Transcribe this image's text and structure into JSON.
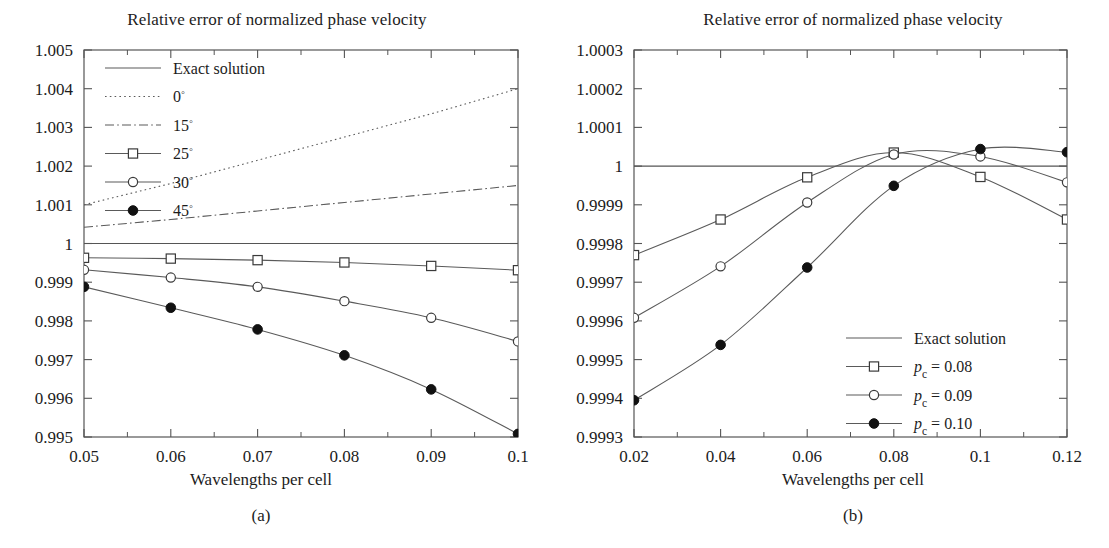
{
  "figure": {
    "background": "#ffffff",
    "line_color": "#5a5a5a",
    "axis_color": "#555555",
    "text_color": "#1c1c1c"
  },
  "panels": [
    {
      "key": "a",
      "title": "Relative error of normalized phase velocity",
      "xlabel": "Wavelengths per cell",
      "subcaption": "(a)"
    },
    {
      "key": "b",
      "title": "Relative error of normalized phase velocity",
      "xlabel": "Wavelengths per cell",
      "subcaption": "(b)"
    }
  ],
  "chart_data": [
    {
      "id": "panel-a",
      "type": "line",
      "title": "Relative error of normalized phase velocity",
      "xlabel": "Wavelengths per cell",
      "ylabel": "",
      "xlim": [
        0.05,
        0.1
      ],
      "ylim": [
        0.995,
        1.005
      ],
      "xticks": [
        0.05,
        0.06,
        0.07,
        0.08,
        0.09,
        0.1
      ],
      "xtick_labels": [
        "0.05",
        "0.06",
        "0.07",
        "0.08",
        "0.09",
        "0.1"
      ],
      "xminor_step": 0.005,
      "yticks": [
        0.995,
        0.996,
        0.997,
        0.998,
        0.999,
        1,
        1.001,
        1.002,
        1.003,
        1.004,
        1.005
      ],
      "ytick_labels": [
        "0.995",
        "0.996",
        "0.997",
        "0.998",
        "0.999",
        "1",
        "1.001",
        "1.002",
        "1.003",
        "1.004",
        "1.005"
      ],
      "grid": false,
      "legend_position": "upper-left",
      "series": [
        {
          "name": "Exact solution",
          "style": "solid",
          "marker": "none",
          "x": [
            0.05,
            0.1
          ],
          "values": [
            1,
            1
          ]
        },
        {
          "name": "0°",
          "style": "dotted",
          "marker": "none",
          "x": [
            0.05,
            0.06,
            0.07,
            0.08,
            0.09,
            0.1
          ],
          "values": [
            1.001,
            1.00155,
            1.00215,
            1.00275,
            1.00335,
            1.004
          ]
        },
        {
          "name": "15°",
          "style": "dashdot",
          "marker": "none",
          "x": [
            0.05,
            0.06,
            0.07,
            0.08,
            0.09,
            0.1
          ],
          "values": [
            1.00042,
            1.00062,
            1.00084,
            1.00106,
            1.00128,
            1.0015
          ]
        },
        {
          "name": "25°",
          "style": "solid",
          "marker": "square-open",
          "x": [
            0.05,
            0.06,
            0.07,
            0.08,
            0.09,
            0.1
          ],
          "values": [
            0.99963,
            0.99961,
            0.99957,
            0.99951,
            0.99942,
            0.99931
          ]
        },
        {
          "name": "30°",
          "style": "solid",
          "marker": "circle-open",
          "x": [
            0.05,
            0.06,
            0.07,
            0.08,
            0.09,
            0.1
          ],
          "values": [
            0.99932,
            0.99912,
            0.99888,
            0.99851,
            0.99808,
            0.99747
          ]
        },
        {
          "name": "45°",
          "style": "solid",
          "marker": "circle-filled",
          "x": [
            0.05,
            0.06,
            0.07,
            0.08,
            0.09,
            0.1
          ],
          "values": [
            0.99888,
            0.99834,
            0.99778,
            0.99711,
            0.99623,
            0.99508
          ]
        }
      ]
    },
    {
      "id": "panel-b",
      "type": "line",
      "title": "Relative error of normalized phase velocity",
      "xlabel": "Wavelengths per cell",
      "ylabel": "",
      "xlim": [
        0.02,
        0.12
      ],
      "ylim": [
        0.9993,
        1.0003
      ],
      "xticks": [
        0.02,
        0.04,
        0.06,
        0.08,
        0.1,
        0.12
      ],
      "xtick_labels": [
        "0.02",
        "0.04",
        "0.06",
        "0.08",
        "0.1",
        "0.12"
      ],
      "xminor_step": 0.01,
      "yticks": [
        0.9993,
        0.9994,
        0.9995,
        0.9996,
        0.9997,
        0.9998,
        0.9999,
        1,
        1.0001,
        1.0002,
        1.0003
      ],
      "ytick_labels": [
        "0.9993",
        "0.9994",
        "0.9995",
        "0.9996",
        "0.9997",
        "0.9998",
        "0.9999",
        "1",
        "1.0001",
        "1.0002",
        "1.0003"
      ],
      "grid": false,
      "legend_position": "lower-right",
      "series": [
        {
          "name": "Exact solution",
          "label_math": null,
          "style": "solid",
          "marker": "none",
          "x": [
            0.02,
            0.12
          ],
          "values": [
            1,
            1
          ]
        },
        {
          "name": "pc = 0.08",
          "label_math": {
            "symbol": "p",
            "subscript": "c",
            "equals": "= 0.08"
          },
          "style": "solid",
          "marker": "square-open",
          "x": [
            0.02,
            0.04,
            0.06,
            0.08,
            0.1,
            0.12
          ],
          "values": [
            0.99977,
            0.999862,
            0.999971,
            1.000035,
            0.999972,
            0.999862
          ]
        },
        {
          "name": "pc = 0.09",
          "label_math": {
            "symbol": "p",
            "subscript": "c",
            "equals": "= 0.09"
          },
          "style": "solid",
          "marker": "circle-open",
          "x": [
            0.02,
            0.04,
            0.06,
            0.08,
            0.1,
            0.12
          ],
          "values": [
            0.999608,
            0.999741,
            0.999906,
            1.00003,
            1.000025,
            0.999958
          ]
        },
        {
          "name": "pc = 0.10",
          "label_math": {
            "symbol": "p",
            "subscript": "c",
            "equals": "= 0.10"
          },
          "style": "solid",
          "marker": "circle-filled",
          "x": [
            0.02,
            0.04,
            0.06,
            0.08,
            0.1,
            0.12
          ],
          "values": [
            0.999395,
            0.999538,
            0.999738,
            0.999949,
            1.000044,
            1.000036
          ]
        }
      ]
    }
  ]
}
